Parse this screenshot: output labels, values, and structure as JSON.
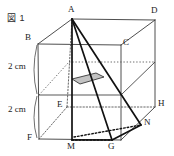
{
  "figure": {
    "caption": "図 1",
    "caption_pos": {
      "x": 7,
      "y": 16
    },
    "vertices": [
      {
        "name": "A",
        "label": "A",
        "x": 72,
        "y": 19,
        "label_x": 68,
        "label_y": 10
      },
      {
        "name": "B",
        "label": "B",
        "x": 38,
        "y": 44,
        "label_x": 25,
        "label_y": 37
      },
      {
        "name": "C",
        "label": "C",
        "x": 121,
        "y": 45,
        "label_x": 121,
        "label_y": 41
      },
      {
        "name": "D",
        "label": "D",
        "x": 155,
        "y": 20,
        "label_x": 151,
        "label_y": 11
      },
      {
        "name": "E",
        "label": "E",
        "x": 67,
        "y": 107,
        "label_x": 58,
        "label_y": 100
      },
      {
        "name": "F",
        "label": "F",
        "x": 39,
        "y": 139,
        "label_x": 28,
        "label_y": 135
      },
      {
        "name": "G",
        "label": "G",
        "x": 112,
        "y": 140,
        "label_x": 109,
        "label_y": 142
      },
      {
        "name": "H",
        "label": "H",
        "x": 151,
        "y": 107,
        "label_x": 155,
        "label_y": 101
      },
      {
        "name": "M",
        "label": "M",
        "x": 72,
        "y": 140,
        "label_x": 68,
        "label_y": 142
      },
      {
        "name": "N",
        "label": "N",
        "x": 141,
        "y": 125,
        "label_x": 143,
        "label_y": 121
      }
    ],
    "dimensions": [
      {
        "name": "upper-height",
        "text": "2 cm",
        "x": 8,
        "y": 61
      },
      {
        "name": "lower-height",
        "text": "2 cm",
        "x": 8,
        "y": 104
      }
    ],
    "colors": {
      "line": "#3a3a3a",
      "solid_line": "#111111",
      "hidden_line": "#555555",
      "shade_fill": "#b9b9b9",
      "background": "#ffffff"
    },
    "geometry": {
      "outline_edges": [
        {
          "name": "edge-A-D",
          "from": "A",
          "to": "D",
          "style": "solid"
        },
        {
          "name": "edge-A-B",
          "from": "A",
          "to": "B",
          "style": "solid"
        },
        {
          "name": "edge-B-C",
          "from": "B",
          "to": "C",
          "style": "solid"
        },
        {
          "name": "edge-C-D",
          "from": "C",
          "to": "D",
          "style": "solid"
        },
        {
          "name": "edge-B-F",
          "from": "B",
          "to": "F",
          "style": "solid"
        },
        {
          "name": "edge-C-G",
          "from": "C",
          "to": "G",
          "style": "solid"
        },
        {
          "name": "edge-D-H",
          "from": "D",
          "to": "H",
          "style": "solid"
        },
        {
          "name": "edge-F-G",
          "from": "F",
          "to": "G",
          "style": "solid"
        },
        {
          "name": "edge-G-H",
          "from": "G",
          "to": "H",
          "style": "solid"
        },
        {
          "name": "edge-A-E",
          "from": "A",
          "to": "E",
          "style": "dotted"
        },
        {
          "name": "edge-E-F",
          "from": "E",
          "to": "F",
          "style": "dotted"
        },
        {
          "name": "edge-E-H",
          "from": "E",
          "to": "H",
          "style": "dotted"
        }
      ],
      "mid_section_levels": [
        {
          "name": "mid-level-front",
          "y_left": 76,
          "y_right": 76
        }
      ],
      "solid_edges": [
        {
          "name": "edge-A-M",
          "from": "A",
          "to": "M"
        },
        {
          "name": "edge-A-G",
          "from": "A",
          "to": "G"
        },
        {
          "name": "edge-A-N",
          "from": "A",
          "to": "N"
        },
        {
          "name": "edge-M-G",
          "from": "M",
          "to": "G"
        },
        {
          "name": "edge-G-N",
          "from": "G",
          "to": "N"
        }
      ],
      "cross_section": {
        "name": "cross-section-quad",
        "points": "72,79 96,73 104,77 80,84"
      }
    }
  }
}
